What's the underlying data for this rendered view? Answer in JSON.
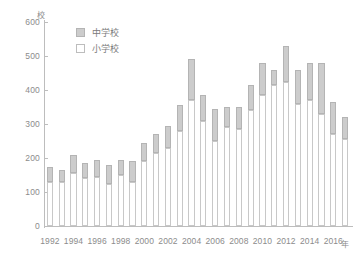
{
  "chart_data": {
    "type": "bar",
    "stacked": true,
    "title": "",
    "subtitle": "",
    "xlabel": "年",
    "ylabel": "校",
    "ylim": [
      0,
      600
    ],
    "ytick_step": 100,
    "yticks": [
      0,
      100,
      200,
      300,
      400,
      500,
      600
    ],
    "ytick_labels": [
      "0",
      "100",
      "200",
      "300",
      "400",
      "500",
      "600"
    ],
    "grid": false,
    "legend_position": "top-left-inside",
    "categories": [
      "1992",
      "1993",
      "1994",
      "1995",
      "1996",
      "1997",
      "1998",
      "1999",
      "2000",
      "2001",
      "2002",
      "2003",
      "2004",
      "2005",
      "2006",
      "2007",
      "2008",
      "2009",
      "2010",
      "2011",
      "2012",
      "2013",
      "2014",
      "2015",
      "2016",
      "2017"
    ],
    "xtick_labels": [
      "1992",
      "1994",
      "1996",
      "1998",
      "2000",
      "2002",
      "2004",
      "2006",
      "2008",
      "2010",
      "2012",
      "2014",
      "2016"
    ],
    "series": [
      {
        "name": "小学校",
        "color": "#ffffff",
        "border": "#c8c8c8",
        "values": [
          130,
          130,
          155,
          140,
          145,
          125,
          150,
          130,
          190,
          215,
          230,
          280,
          370,
          310,
          250,
          290,
          285,
          340,
          385,
          415,
          425,
          360,
          370,
          330,
          270,
          255
        ]
      },
      {
        "name": "中学校",
        "color": "#cccccc",
        "border": "#b4b4b4",
        "values": [
          45,
          35,
          55,
          45,
          50,
          55,
          45,
          60,
          55,
          55,
          65,
          75,
          120,
          75,
          95,
          60,
          65,
          75,
          95,
          45,
          105,
          100,
          110,
          150,
          95,
          65
        ]
      }
    ],
    "totals": [
      175,
      165,
      210,
      185,
      195,
      180,
      195,
      190,
      245,
      270,
      295,
      355,
      490,
      385,
      345,
      350,
      350,
      415,
      480,
      460,
      530,
      460,
      480,
      480,
      365,
      320
    ]
  },
  "legend": {
    "items": [
      {
        "label": "中学校",
        "swatch": "gray"
      },
      {
        "label": "小学校",
        "swatch": "white"
      }
    ]
  },
  "axis": {
    "y_unit": "校",
    "x_unit": "年"
  },
  "colors": {
    "secondary_fill": "#cccccc",
    "secondary_border": "#b4b4b4",
    "primary_fill": "#ffffff",
    "primary_border": "#c8c8c8",
    "axis": "#bdbdbd",
    "text": "#8c8c8c",
    "background": "#ffffff"
  }
}
